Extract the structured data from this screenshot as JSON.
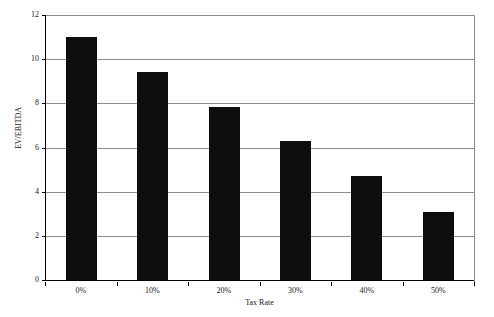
{
  "chart_data": {
    "type": "bar",
    "title": "",
    "subtitle": "",
    "xlabel": "Tax Rate",
    "ylabel": "EV/EBITDA",
    "categories": [
      "0%",
      "10%",
      "20%",
      "30%",
      "40%",
      "50%"
    ],
    "values": [
      11.0,
      9.4,
      7.85,
      6.3,
      4.7,
      3.1
    ],
    "series": [
      {
        "name": "EV/EBITDA",
        "values": [
          11.0,
          9.4,
          7.85,
          6.3,
          4.7,
          3.1
        ]
      }
    ],
    "ylim": [
      0,
      12
    ],
    "xlim": [
      0,
      6
    ],
    "y_ticks": [
      0,
      2,
      4,
      6,
      8,
      10,
      12
    ],
    "y_tick_labels": [
      "0",
      "2",
      "4",
      "6",
      "8",
      "10",
      "12"
    ],
    "x_tick_labels": [
      "0%",
      "10%",
      "20%",
      "30%",
      "40%",
      "50%"
    ],
    "grid": true,
    "grid_axis": "y",
    "legend": false,
    "legend_position": "none",
    "bar_color": "#0d0d0d",
    "grid_color": "#8c8c8c",
    "axis_color": "#000000",
    "background_color": "#ffffff",
    "annotations": []
  }
}
